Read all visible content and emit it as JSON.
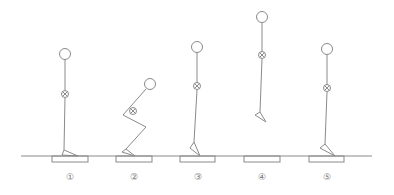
{
  "diagram": {
    "ground_line": {
      "x1": 21,
      "x2": 372,
      "y": 156
    },
    "phases": [
      {
        "label": "①",
        "name": "standing",
        "x": 70
      },
      {
        "label": "②",
        "name": "countermovement-squat",
        "x": 134
      },
      {
        "label": "③",
        "name": "takeoff",
        "x": 198
      },
      {
        "label": "④",
        "name": "flight",
        "x": 262
      },
      {
        "label": "⑤",
        "name": "landing",
        "x": 327
      }
    ]
  }
}
